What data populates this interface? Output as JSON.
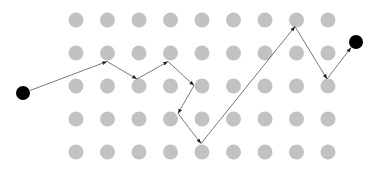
{
  "diagram": {
    "type": "grid-path",
    "grid": {
      "columns": 9,
      "rows": 5,
      "x0": 76,
      "y0": 20,
      "dx": 31.5,
      "dy": 33,
      "dot_radius": 7.5,
      "dot_color": "#c2c2c2"
    },
    "start_node": {
      "x": 23,
      "y": 93,
      "r": 7,
      "color": "#000000"
    },
    "end_node": {
      "x": 356,
      "y": 42,
      "r": 7,
      "color": "#000000"
    },
    "path": {
      "color": "#555555",
      "width": 0.8,
      "points": [
        [
          30,
          90.5
        ],
        [
          107,
          61.5
        ],
        [
          137,
          79
        ],
        [
          168,
          61.5
        ],
        [
          194,
          85.5
        ],
        [
          178,
          113.5
        ],
        [
          201,
          143.5
        ],
        [
          295,
          26.5
        ],
        [
          327,
          79
        ],
        [
          351,
          47.5
        ]
      ]
    }
  }
}
